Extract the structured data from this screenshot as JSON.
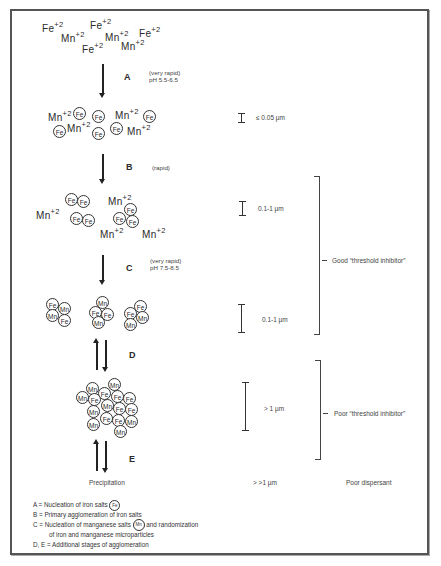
{
  "stage0": {
    "ions": [
      {
        "sym": "Fe",
        "charge": "+2"
      },
      {
        "sym": "Fe",
        "charge": "+2"
      },
      {
        "sym": "Mn",
        "charge": "+2"
      },
      {
        "sym": "Mn",
        "charge": "+2"
      },
      {
        "sym": "Fe",
        "charge": "+2"
      },
      {
        "sym": "Fe",
        "charge": "+2"
      },
      {
        "sym": "Mn",
        "charge": "+2"
      }
    ]
  },
  "steps": {
    "A": {
      "label": "A",
      "note_line1": "(very rapid)",
      "note_line2": "pH 5.5-6.5"
    },
    "B": {
      "label": "B",
      "note_line1": "(rapid)"
    },
    "C": {
      "label": "C",
      "note_line1": "(very rapid)",
      "note_line2": "pH 7.5-8.5"
    },
    "D": {
      "label": "D"
    },
    "E": {
      "label": "E"
    }
  },
  "particles": {
    "fe": "Fe",
    "mn": "Mn",
    "ion_mn": "Mn",
    "charge": "+2"
  },
  "sizes": {
    "s1": "≤ 0.05 µm",
    "s2": "0.1-1 µm",
    "s3": "0.1-1 µm",
    "s4": "> 1 µm",
    "s5": "> >1 µm"
  },
  "brackets": {
    "good": "Good “threshold inhibitor”",
    "poor": "Poor “threshold inhibitor”"
  },
  "bottom": {
    "precipitation": "Precipitation",
    "size": "> >1 µm",
    "dispersant": "Poor dispersant"
  },
  "legend": {
    "a": "A  =  Nucleation of iron salts",
    "b": "B  =  Primary agglomeration of iron salts",
    "c1": "C  =  Nucleation of manganese salts",
    "c1b": "and randomization",
    "c2": "of iron and manganese microparticles",
    "de": "D, E  =  Additional stages of agglomeration"
  }
}
